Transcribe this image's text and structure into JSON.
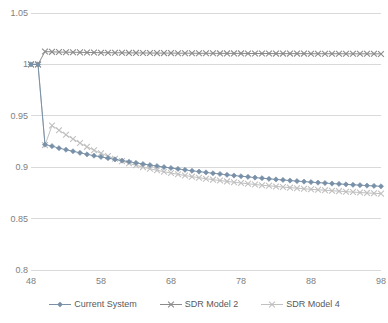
{
  "chart_data": {
    "type": "line",
    "title": "",
    "subtitle": "",
    "xlabel": "",
    "ylabel": "",
    "xlim": [
      48,
      98
    ],
    "ylim": [
      0.8,
      1.05
    ],
    "grid": true,
    "grid_axis": "y",
    "legend_position": "bottom",
    "x_ticks": [
      "48",
      "58",
      "68",
      "78",
      "88",
      "98"
    ],
    "x_tick_values": [
      48,
      58,
      68,
      78,
      88,
      98
    ],
    "y_ticks": [
      "0.8",
      "0.85",
      "0.9",
      "0.95",
      "1",
      "1.05"
    ],
    "y_tick_values": [
      0.8,
      0.85,
      0.9,
      0.95,
      1.0,
      1.05
    ],
    "x": [
      48,
      49,
      50,
      51,
      52,
      53,
      54,
      55,
      56,
      57,
      58,
      59,
      60,
      61,
      62,
      63,
      64,
      65,
      66,
      67,
      68,
      69,
      70,
      71,
      72,
      73,
      74,
      75,
      76,
      77,
      78,
      79,
      80,
      81,
      82,
      83,
      84,
      85,
      86,
      87,
      88,
      89,
      90,
      91,
      92,
      93,
      94,
      95,
      96,
      97,
      98
    ],
    "series": [
      {
        "name": "Current System",
        "color": "#7890a8",
        "marker": "diamond",
        "values": [
          1.0,
          1.0,
          0.922,
          0.9205,
          0.9185,
          0.917,
          0.9155,
          0.914,
          0.9125,
          0.9112,
          0.91,
          0.9088,
          0.9076,
          0.9064,
          0.9053,
          0.9042,
          0.9031,
          0.9021,
          0.9011,
          0.9001,
          0.8992,
          0.8983,
          0.8974,
          0.8965,
          0.8957,
          0.8949,
          0.8941,
          0.8934,
          0.8926,
          0.8919,
          0.8912,
          0.8906,
          0.8899,
          0.8893,
          0.8887,
          0.8881,
          0.8876,
          0.887,
          0.8865,
          0.886,
          0.8855,
          0.885,
          0.8846,
          0.8841,
          0.8837,
          0.8833,
          0.8829,
          0.8825,
          0.8821,
          0.8818,
          0.8814
        ]
      },
      {
        "name": "SDR Model 2",
        "color": "#8b8b8b",
        "marker": "x",
        "values": [
          1.0,
          1.0,
          1.0125,
          1.0122,
          1.012,
          1.0119,
          1.0118,
          1.0117,
          1.0116,
          1.0115,
          1.0114,
          1.0114,
          1.0113,
          1.0113,
          1.0112,
          1.0112,
          1.0111,
          1.0111,
          1.011,
          1.011,
          1.011,
          1.0109,
          1.0109,
          1.0109,
          1.0108,
          1.0108,
          1.0108,
          1.0107,
          1.0107,
          1.0107,
          1.0107,
          1.0106,
          1.0106,
          1.0106,
          1.0106,
          1.0105,
          1.0105,
          1.0105,
          1.0105,
          1.0105,
          1.0104,
          1.0104,
          1.0104,
          1.0104,
          1.0104,
          1.0103,
          1.0103,
          1.0103,
          1.0103,
          1.0103,
          1.0102
        ]
      },
      {
        "name": "SDR Model 4",
        "color": "#c0c0c0",
        "marker": "x",
        "values": [
          1.0,
          1.0,
          0.9215,
          0.9405,
          0.936,
          0.9315,
          0.9275,
          0.9235,
          0.9198,
          0.9165,
          0.9135,
          0.9108,
          0.9082,
          0.9059,
          0.9038,
          0.9019,
          0.9001,
          0.8985,
          0.897,
          0.8956,
          0.8943,
          0.8931,
          0.8919,
          0.8908,
          0.8898,
          0.8888,
          0.8879,
          0.887,
          0.8862,
          0.8854,
          0.8846,
          0.8839,
          0.8832,
          0.8825,
          0.8819,
          0.8813,
          0.8807,
          0.8801,
          0.8796,
          0.879,
          0.8785,
          0.878,
          0.8776,
          0.8771,
          0.8767,
          0.8762,
          0.8758,
          0.8754,
          0.875,
          0.8746,
          0.8743
        ]
      }
    ],
    "legend": [
      {
        "label": "Current System",
        "color": "#7890a8",
        "marker": "diamond"
      },
      {
        "label": "SDR Model 2",
        "color": "#8b8b8b",
        "marker": "x"
      },
      {
        "label": "SDR Model 4",
        "color": "#c0c0c0",
        "marker": "x"
      }
    ],
    "colors": {
      "grid": "#d9d9d9",
      "tick_text": "#808080",
      "legend_text": "#595959",
      "background": "#ffffff"
    }
  }
}
